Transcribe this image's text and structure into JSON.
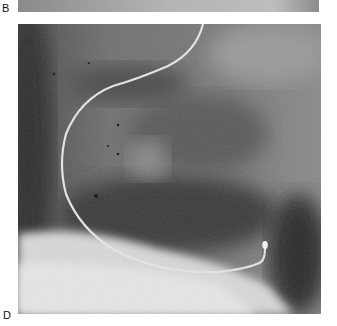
{
  "figure": {
    "panels": [
      {
        "label": "B",
        "description": "bottom edge of radiograph panel B"
      },
      {
        "label": "D",
        "description": "fluoroscopic radiograph showing a curved guidewire/catheter"
      }
    ]
  }
}
